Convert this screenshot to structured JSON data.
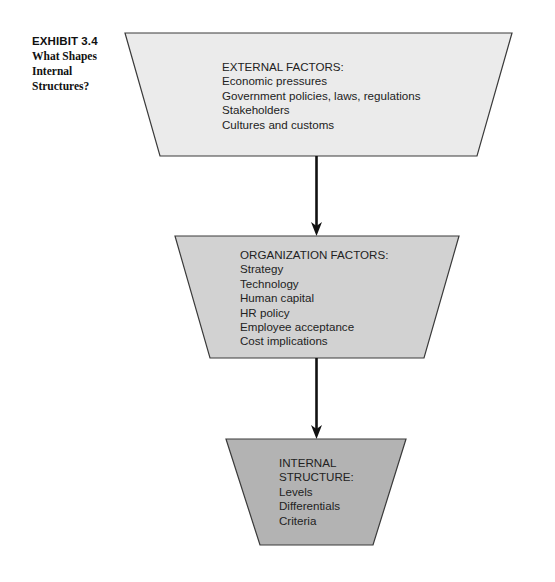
{
  "exhibit": {
    "number": "EXHIBIT 3.4",
    "title_lines": [
      "What Shapes",
      "Internal",
      "Structures?"
    ]
  },
  "colors": {
    "external_fill": "#ebebeb",
    "organization_fill": "#d2d2d2",
    "internal_fill": "#b3b3b3",
    "stroke": "#3a3a3a",
    "arrow": "#111111"
  },
  "boxes": {
    "external": {
      "heading": "EXTERNAL FACTORS:",
      "items": [
        "Economic pressures",
        "Government policies, laws, regulations",
        "Stakeholders",
        "Cultures and customs"
      ]
    },
    "organization": {
      "heading": "ORGANIZATION FACTORS:",
      "items": [
        "Strategy",
        "Technology",
        "Human capital",
        "HR policy",
        "Employee acceptance",
        "Cost implications"
      ]
    },
    "internal": {
      "heading_lines": [
        "INTERNAL",
        "STRUCTURE:"
      ],
      "items": [
        "Levels",
        "Differentials",
        "Criteria"
      ]
    }
  }
}
